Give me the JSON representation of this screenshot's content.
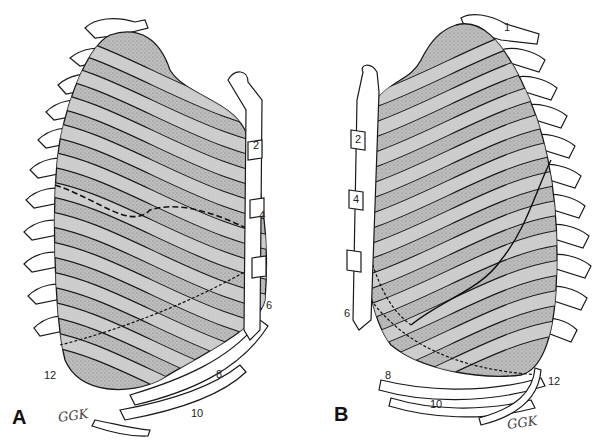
{
  "figure": {
    "panels": [
      {
        "id": "A",
        "letter": "A",
        "view": "left lateral view of lung projected on rib cage",
        "rib_labels": [
          "2",
          "4",
          "6",
          "8",
          "10",
          "12"
        ],
        "signature": "GGK"
      },
      {
        "id": "B",
        "letter": "B",
        "view": "right lateral view of lung projected on rib cage",
        "rib_labels": [
          "1",
          "2",
          "4",
          "6",
          "8",
          "10",
          "12"
        ],
        "signature": "GGK"
      }
    ],
    "colors": {
      "lung_fill": "#bdbdbd",
      "lung_shadow": "#8a8a8a",
      "rib_fill": "#d4d4d4",
      "bone_fill": "#ffffff",
      "outline": "#1a1a1a"
    }
  }
}
